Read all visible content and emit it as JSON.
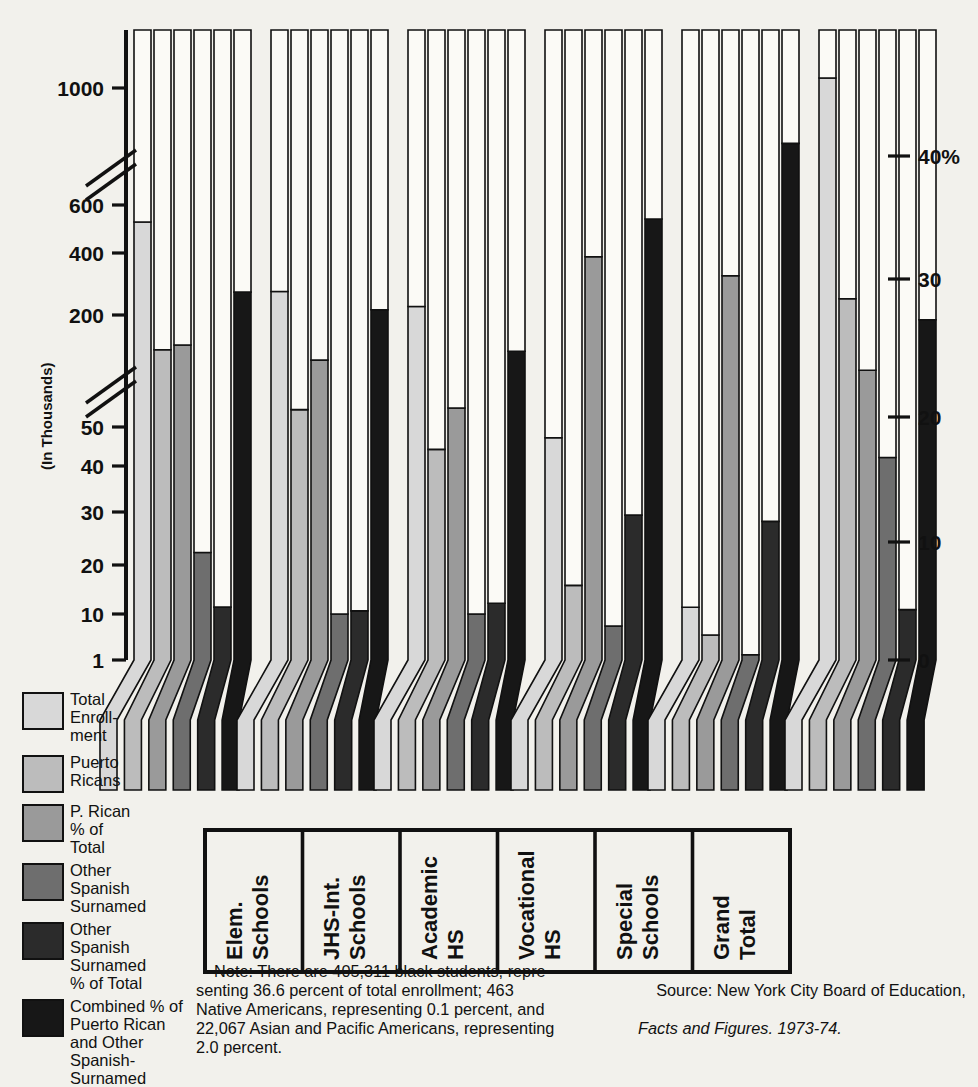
{
  "axes": {
    "y_title": "(In Thousands)",
    "y_ticks": [
      "1000",
      "600",
      "400",
      "200",
      "50",
      "40",
      "30",
      "20",
      "10",
      "1"
    ],
    "y_right_ticks": [
      "40%",
      "30",
      "20",
      "10",
      "0"
    ],
    "break_marks": 2
  },
  "legend": {
    "items": [
      {
        "label": "Total\nEnroll-\nment",
        "color": "#d8d8d8",
        "name": "total-enrollment"
      },
      {
        "label": "Puerto\nRicans",
        "color": "#bcbcbc",
        "name": "puerto-ricans"
      },
      {
        "label": "P. Rican\n% of\nTotal",
        "color": "#9a9a9a",
        "name": "p-rican-pct-of-total"
      },
      {
        "label": "Other\nSpanish\nSurnamed",
        "color": "#6e6e6e",
        "name": "other-spanish-surnamed"
      },
      {
        "label": "Other\nSpanish\nSurnamed\n% of Total",
        "color": "#2b2b2b",
        "name": "other-spanish-surnamed-pct"
      },
      {
        "label": "Combined % of\nPuerto Rican\nand Other\nSpanish-\nSurnamed",
        "color": "#171717",
        "name": "combined-pct"
      }
    ]
  },
  "note": "    Note: There are 405,311 black students, repre-\nsenting 36.6 percent of total enrollment; 463\nNative Americans, representing 0.1 percent, and\n22,067 Asian and Pacific Americans, representing\n2.0 percent.",
  "source": {
    "line1": "    Source: New York City Board of Education,",
    "line2": "Facts and Figures. 1973-74."
  },
  "chart_data": {
    "type": "bar",
    "title": "",
    "xlabel": "",
    "ylabel": "(In Thousands)",
    "ylabel_right": "%",
    "ylim_left": [
      1,
      1400
    ],
    "ylim_right": [
      0,
      47
    ],
    "scale": "broken-log",
    "grid": false,
    "legend_position": "left",
    "categories": [
      "Elem. Schools",
      "JHS-Int. Schools",
      "Academic HS",
      "Vocational HS",
      "Special Schools",
      "Grand Total"
    ],
    "series": [
      {
        "name": "Total Enrollment",
        "unit": "thousands",
        "axis": "left",
        "color": "#d8d8d8",
        "values": [
          520,
          260,
          220,
          47,
          11,
          1060
        ]
      },
      {
        "name": "Puerto Ricans",
        "unit": "thousands",
        "axis": "left",
        "color": "#bcbcbc",
        "values": [
          130,
          62,
          44,
          15,
          3.5,
          240
        ]
      },
      {
        "name": "P. Rican % of Total",
        "unit": "percent",
        "axis": "right",
        "color": "#9a9a9a",
        "values": [
          25.0,
          23.8,
          20.0,
          32.0,
          30.5,
          23.0
        ]
      },
      {
        "name": "Other Spanish Surnamed",
        "unit": "thousands",
        "axis": "left",
        "color": "#6e6e6e",
        "values": [
          22,
          10,
          10,
          5.5,
          1.3,
          42
        ]
      },
      {
        "name": "Other Spanish Surnamed % of Total",
        "unit": "percent",
        "axis": "right",
        "color": "#2b2b2b",
        "values": [
          4.2,
          3.9,
          4.5,
          11.5,
          11.0,
          4.0
        ]
      },
      {
        "name": "Combined % of Puerto Rican and Other Spanish-Surnamed",
        "unit": "percent",
        "axis": "right",
        "color": "#171717",
        "values": [
          29.2,
          27.8,
          24.5,
          35.0,
          41.0,
          27.0
        ]
      }
    ],
    "annotations": [
      "Note: There are 405,311 black students, representing 36.6 percent of total enrollment; 463 Native Americans, representing 0.1 percent, and 22,067 Asian and Pacific Americans, representing 2.0 percent."
    ]
  }
}
